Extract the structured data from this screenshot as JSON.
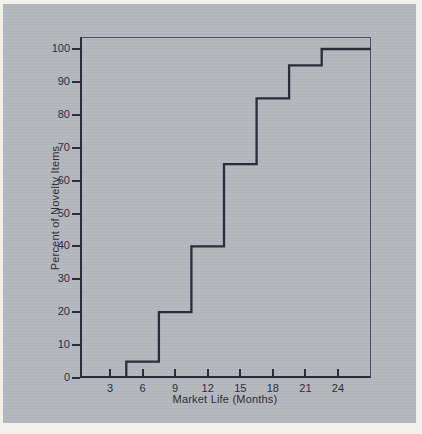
{
  "figure": {
    "page_color": "#f1f0e9",
    "panel_color": "#b5b8be",
    "line_color": "#2a2e38",
    "frame_color": "#4d515c",
    "text_color": "#2d3039"
  },
  "chart_data": {
    "type": "line",
    "subtype": "step",
    "title": "",
    "xlabel": "Market Life (Months)",
    "ylabel": "Percent of Novelty Items",
    "xlim": [
      0,
      27
    ],
    "ylim": [
      0,
      104
    ],
    "x_ticks": [
      3,
      6,
      9,
      12,
      15,
      18,
      21,
      24
    ],
    "y_ticks": [
      0,
      10,
      20,
      30,
      40,
      50,
      60,
      70,
      80,
      90,
      100
    ],
    "grid": false,
    "legend": false,
    "points": [
      [
        4.5,
        0
      ],
      [
        4.5,
        5
      ],
      [
        7.5,
        5
      ],
      [
        7.5,
        20
      ],
      [
        10.5,
        20
      ],
      [
        10.5,
        40
      ],
      [
        13.5,
        40
      ],
      [
        13.5,
        65
      ],
      [
        16.5,
        65
      ],
      [
        16.5,
        85
      ],
      [
        19.5,
        85
      ],
      [
        19.5,
        95
      ],
      [
        22.5,
        95
      ],
      [
        22.5,
        100
      ],
      [
        27,
        100
      ]
    ]
  }
}
